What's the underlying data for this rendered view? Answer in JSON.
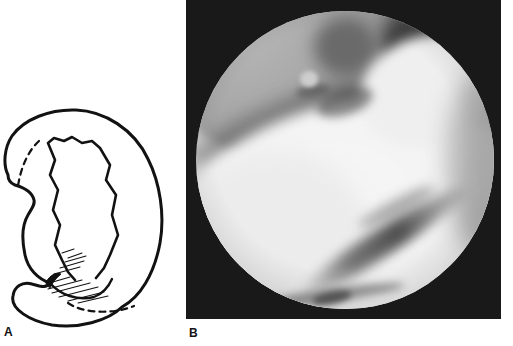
{
  "figure": {
    "panels": {
      "a": {
        "label": "A",
        "kind": "meniscus-tear-line-drawing"
      },
      "b": {
        "label": "B",
        "kind": "arthroscopic-photograph"
      }
    },
    "colors": {
      "page_bg": "#ffffff",
      "ink": "#121212",
      "panel_b_bg": "#191919",
      "condyle_gray": "#a2a2a2",
      "tissue_white": "#f2f2f2",
      "crease_dark": "#4e4e4e"
    }
  }
}
